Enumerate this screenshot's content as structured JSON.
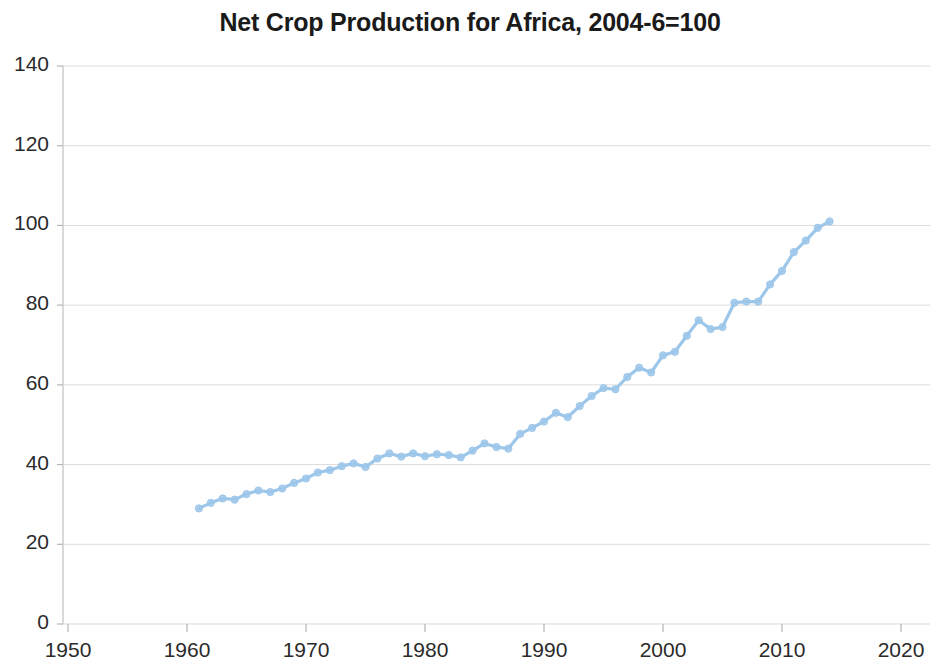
{
  "chart_data": {
    "type": "line",
    "title": "Net Crop Production for Africa, 2004-6=100",
    "xlabel": "",
    "ylabel": "",
    "xlim": [
      1950,
      2020
    ],
    "ylim": [
      0,
      140
    ],
    "xticks": [
      1950,
      1960,
      1970,
      1980,
      1990,
      2000,
      2010,
      2020
    ],
    "yticks": [
      0,
      20,
      40,
      60,
      80,
      100,
      120,
      140
    ],
    "grid": "horizontal",
    "legend": "none",
    "series": [
      {
        "name": "Net Crop Production for Africa",
        "color": "#9dc7ea",
        "marker": "circle",
        "x": [
          1961,
          1962,
          1963,
          1964,
          1965,
          1966,
          1967,
          1968,
          1969,
          1970,
          1971,
          1972,
          1973,
          1974,
          1975,
          1976,
          1977,
          1978,
          1979,
          1980,
          1981,
          1982,
          1983,
          1984,
          1985,
          1986,
          1987,
          1988,
          1989,
          1990,
          1991,
          1992,
          1993,
          1994,
          1995,
          1996,
          1997,
          1998,
          1999,
          2000,
          2001,
          2002,
          2003,
          2004,
          2005,
          2006,
          2007,
          2008,
          2009,
          2010,
          2011,
          2012,
          2013,
          2014
        ],
        "values": [
          29.0,
          30.4,
          31.5,
          31.2,
          32.6,
          33.5,
          33.1,
          34.0,
          35.4,
          36.5,
          38.0,
          38.6,
          39.6,
          40.3,
          39.4,
          41.5,
          42.8,
          42.0,
          42.8,
          42.1,
          42.6,
          42.4,
          41.8,
          43.5,
          45.3,
          44.4,
          44.0,
          47.7,
          49.2,
          50.8,
          53.0,
          51.9,
          54.7,
          57.2,
          59.2,
          58.9,
          62.0,
          64.3,
          63.1,
          67.4,
          68.3,
          72.3,
          76.2,
          74.0,
          74.5,
          80.6,
          80.9,
          80.9,
          85.2,
          88.6,
          93.3,
          96.2,
          99.4,
          101.0
        ]
      }
    ]
  },
  "axis": {
    "y_tick_labels": [
      "140",
      "120",
      "100",
      "80",
      "60",
      "40",
      "20",
      "0"
    ],
    "x_tick_labels": [
      "1950",
      "1960",
      "1970",
      "1980",
      "1990",
      "2000",
      "2010",
      "2020"
    ]
  }
}
